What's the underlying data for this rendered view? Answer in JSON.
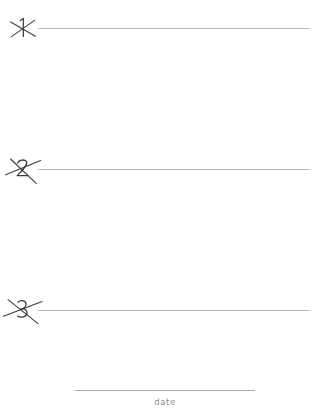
{
  "page": {
    "background_color": "#ffffff",
    "width": 329,
    "height": 419,
    "kind": "handwriting-practice-lined-sheet"
  },
  "rule_lines": [
    {
      "number_label": "1",
      "number_state": "crossed-out",
      "line_color": "#b9b9bd",
      "top": 9
    },
    {
      "number_label": "2",
      "number_state": "crossed-out",
      "line_color": "#b9b9bd",
      "top": 150
    },
    {
      "number_label": "3",
      "number_state": "crossed-out",
      "line_color": "#b9b9bd",
      "top": 291
    }
  ],
  "date_field": {
    "label": "date",
    "value": "",
    "line_color": "#a9a9ad",
    "label_color": "#8b8b90"
  },
  "ink": {
    "stroke_color": "#3a3a3c",
    "strike_color": "#3c3c3e"
  }
}
